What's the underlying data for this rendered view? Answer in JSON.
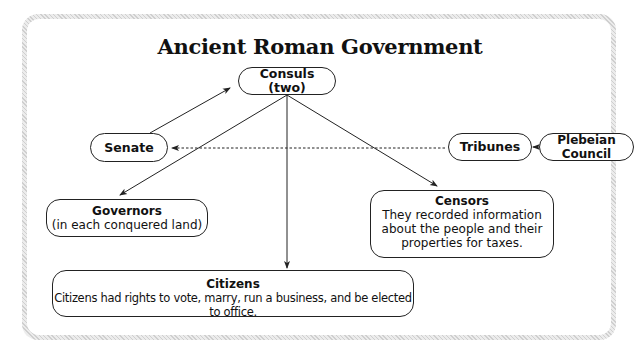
{
  "title": "Ancient Roman Government",
  "nodes": {
    "consuls": {
      "label": "Consuls (two)"
    },
    "senate": {
      "label": "Senate"
    },
    "tribunes": {
      "label": "Tribunes"
    },
    "plebeian_council": {
      "label": "Plebeian Council"
    },
    "governors": {
      "label": "Governors",
      "desc": "(in each conquered land)"
    },
    "censors": {
      "label": "Censors",
      "desc_lines": [
        "They recorded information",
        "about the people and their",
        "properties for taxes."
      ]
    },
    "citizens": {
      "label": "Citizens",
      "desc": "Citizens had rights to vote, marry, run a business, and be elected to office."
    }
  },
  "edges": [
    {
      "from": "Senate",
      "to": "Consuls (two)",
      "style": "solid"
    },
    {
      "from": "Consuls (two)",
      "to": "Governors",
      "style": "solid"
    },
    {
      "from": "Consuls (two)",
      "to": "Citizens",
      "style": "solid"
    },
    {
      "from": "Consuls (two)",
      "to": "Censors",
      "style": "solid"
    },
    {
      "from": "Tribunes",
      "to": "Senate",
      "style": "dashed"
    },
    {
      "from": "Plebeian Council",
      "to": "Tribunes",
      "style": "solid"
    }
  ]
}
